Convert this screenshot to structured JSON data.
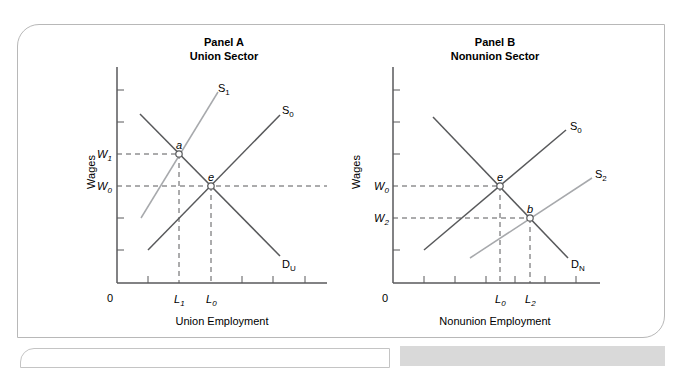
{
  "panel_a": {
    "title_line1": "Panel A",
    "title_line2": "Union Sector",
    "y_label": "Wages",
    "x_label": "Union Employment",
    "origin": "0",
    "w1": "W",
    "w1_sub": "1",
    "w0": "W",
    "w0_sub": "0",
    "l1": "L",
    "l1_sub": "1",
    "l0": "L",
    "l0_sub": "0",
    "s1": "S",
    "s1_sub": "1",
    "s0": "S",
    "s0_sub": "0",
    "d": "D",
    "d_sub": "U",
    "point_a": "a",
    "point_e": "e"
  },
  "panel_b": {
    "title_line1": "Panel B",
    "title_line2": "Nonunion Sector",
    "y_label": "Wages",
    "x_label": "Nonunion Employment",
    "origin": "0",
    "w0": "W",
    "w0_sub": "0",
    "w2": "W",
    "w2_sub": "2",
    "l0": "L",
    "l0_sub": "0",
    "l2": "L",
    "l2_sub": "2",
    "s0": "S",
    "s0_sub": "0",
    "s2": "S",
    "s2_sub": "2",
    "d": "D",
    "d_sub": "N",
    "point_e": "e",
    "point_b": "b"
  },
  "colors": {
    "dark_line": "#58595b",
    "light_line": "#a7a9ac",
    "text": "#231f20"
  }
}
